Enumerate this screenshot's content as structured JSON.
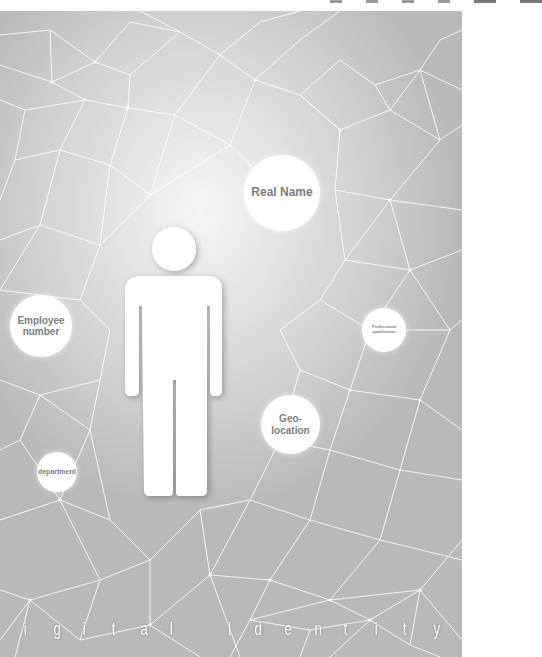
{
  "poster": {
    "title_letters": [
      "i",
      "g",
      "i",
      "t",
      "a",
      "l",
      "I",
      "d",
      "e",
      "n",
      "t",
      "i",
      "t",
      "y"
    ],
    "title_text": "igital Identity",
    "colors": {
      "background_light": "#f6f6f6",
      "background_dark": "#b9b9b9",
      "mesh_lines": "#ffffff",
      "bubble_text": "#7d7d7d",
      "bubble_fill": "#ffffff"
    },
    "bubbles": [
      {
        "id": "real-name",
        "label": "Real Name"
      },
      {
        "id": "employee-number",
        "label_line1": "Employee",
        "label_line2": "number"
      },
      {
        "id": "professional-qualification",
        "label_line1": "Professional",
        "label_line2": "qualification"
      },
      {
        "id": "geo-location",
        "label_line1": "Geo-",
        "label_line2": "location"
      },
      {
        "id": "department",
        "label": "department"
      }
    ],
    "figure": "person-silhouette-icon"
  }
}
